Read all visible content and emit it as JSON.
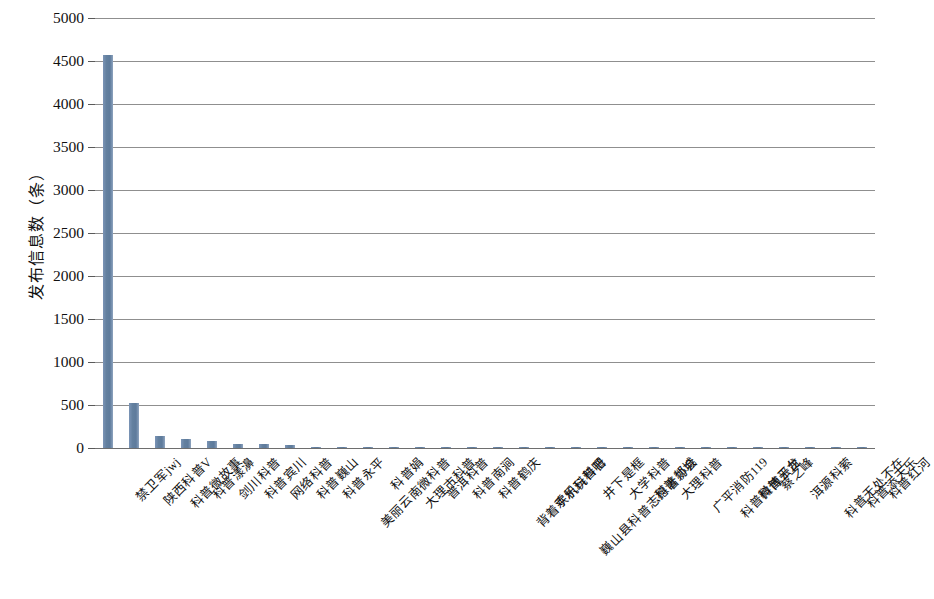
{
  "chart_data": {
    "type": "bar",
    "title": "",
    "subtitle": "",
    "xlabel": "",
    "ylabel": "发布信息数（条）",
    "ylim": [
      0,
      5000
    ],
    "ytick_step": 500,
    "yticks": [
      "5000",
      "4500",
      "4000",
      "3500",
      "3000",
      "2500",
      "2000",
      "1500",
      "1000",
      "500",
      "0"
    ],
    "grid": true,
    "legend": false,
    "bar_color": "#6b87ab",
    "categories": [
      "禁卫军jwj",
      "陕西科普V",
      "科普微故事",
      "科普漾濞",
      "剑川科普",
      "科普宾川",
      "网络科普",
      "科普巍山",
      "科普永平",
      "美丽云南微科普",
      "科普娟",
      "大理市科普",
      "普洱科普",
      "科普南涧",
      "科普鹤庆",
      "背着手机玩科普",
      "欢乐科普吧",
      "巍山县科普志愿者协会",
      "井下是框",
      "大学科普",
      "科普郯城",
      "大理科普",
      "广平消防119",
      "科普微博平台",
      "科普云龙",
      "蔡之峰",
      "洱源科萦",
      "科普无处不在",
      "科普添天乐",
      "科普红河"
    ],
    "values": [
      4570,
      520,
      140,
      100,
      85,
      45,
      42,
      38,
      14,
      10,
      9,
      9,
      8,
      8,
      7,
      6,
      6,
      5,
      5,
      4,
      4,
      3,
      3,
      3,
      2,
      2,
      2,
      2,
      1,
      1
    ]
  }
}
